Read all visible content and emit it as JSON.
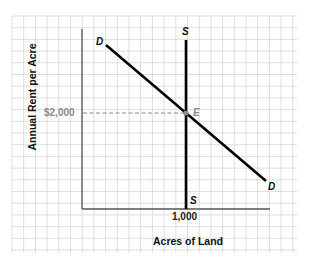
{
  "chart_data": {
    "type": "line",
    "title": "",
    "xlabel": "Acres of Land",
    "ylabel": "Annual Rent per Acre",
    "grid": true,
    "legend": "none",
    "x_ticks": [
      "1,000"
    ],
    "y_ticks": [
      "$2,000"
    ],
    "series": [
      {
        "name": "D",
        "label_start": "D",
        "label_end": "D",
        "kind": "demand",
        "slope": "downward"
      },
      {
        "name": "S",
        "label_top": "S",
        "label_bottom": "S",
        "kind": "supply",
        "slope": "vertical",
        "x": 1000
      }
    ],
    "equilibrium": {
      "label": "E",
      "x": 1000,
      "y": 2000
    },
    "annotations": [
      "dashed guide from $2,000 to E"
    ]
  },
  "labels": {
    "d_start": "D",
    "d_end": "D",
    "s_top": "S",
    "s_bottom": "S",
    "e": "E",
    "y_tick": "$2,000",
    "x_tick": "1,000",
    "ylabel": "Annual Rent per Acre",
    "xlabel": "Acres of Land"
  },
  "colors": {
    "grid": "#d6d6d6",
    "axis": "#555555",
    "curve": "#000000",
    "guide": "#8a8a8a",
    "tick_text_y": "#8a8a8a",
    "tick_text_x": "#222222"
  }
}
